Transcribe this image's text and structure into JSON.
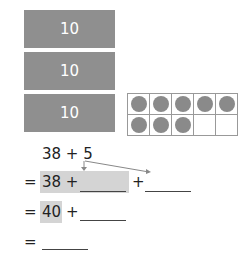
{
  "blocks": [
    {
      "label": "10"
    },
    {
      "label": "10"
    },
    {
      "label": "10"
    }
  ],
  "ten_frame": {
    "rows": 2,
    "cols": 5,
    "filled": 8,
    "total": 10
  },
  "problem": {
    "expression": "38 + 5",
    "line1": {
      "equals": "=",
      "left": "38 +",
      "plus": "+"
    },
    "line2": {
      "equals": "=",
      "left": "40",
      "plus": "+"
    },
    "line3": {
      "equals": "="
    }
  }
}
